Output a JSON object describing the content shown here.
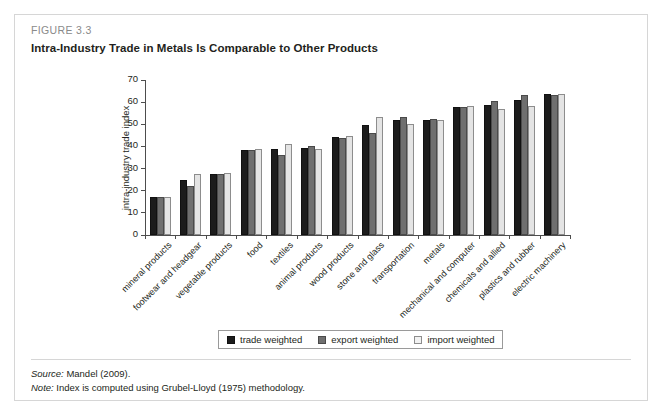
{
  "figure": {
    "number": "FIGURE 3.3",
    "title": "Intra-Industry Trade in Metals Is Comparable to Other Products",
    "source_label": "Source:",
    "source_text": " Mandel (2009).",
    "note_label": "Note:",
    "note_text": " Index is computed using Grubel-Lloyd (1975) methodology."
  },
  "legend": {
    "items": [
      {
        "label": "trade weighted",
        "color": "#1c1c1c"
      },
      {
        "label": "export weighted",
        "color": "#6f6f6f"
      },
      {
        "label": "import weighted",
        "color": "#e4e4e4"
      }
    ]
  },
  "chart_data": {
    "type": "bar",
    "title": "Intra-Industry Trade in Metals Is Comparable to Other Products",
    "xlabel": "",
    "ylabel": "intra-industry trade index",
    "ylim": [
      0,
      70
    ],
    "yticks": [
      0,
      10,
      20,
      30,
      40,
      50,
      60,
      70
    ],
    "grid": false,
    "legend_position": "bottom",
    "categories": [
      "mineral products",
      "footwear and headgear",
      "vegetable products",
      "food",
      "textiles",
      "animal products",
      "wood products",
      "stone and glass",
      "transportation",
      "metals",
      "mechanical and computer",
      "chemicals and allied",
      "plastics and rubber",
      "electric machinery"
    ],
    "series": [
      {
        "name": "trade weighted",
        "color": "#1c1c1c",
        "values": [
          17.0,
          24.7,
          27.6,
          38.5,
          38.8,
          39.4,
          44.3,
          49.6,
          51.8,
          52.0,
          58.0,
          58.8,
          61.0,
          63.6
        ]
      },
      {
        "name": "export weighted",
        "color": "#6f6f6f",
        "values": [
          17.0,
          22.0,
          27.4,
          38.2,
          36.0,
          40.0,
          43.8,
          46.1,
          53.5,
          52.2,
          58.0,
          60.3,
          63.1,
          63.4
        ]
      },
      {
        "name": "import weighted",
        "color": "#e4e4e4",
        "values": [
          17.2,
          27.4,
          27.9,
          38.7,
          41.3,
          39.0,
          44.8,
          53.2,
          50.1,
          51.9,
          58.3,
          57.0,
          58.2,
          63.6
        ]
      }
    ]
  }
}
